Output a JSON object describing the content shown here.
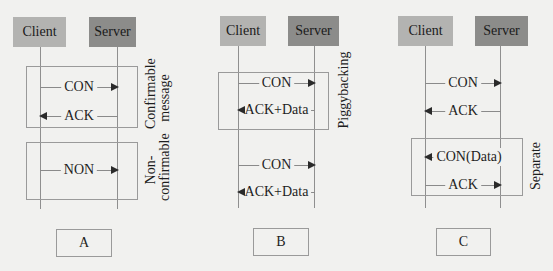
{
  "diagrams": [
    {
      "id": "A",
      "caption": "A",
      "client_label": "Client",
      "server_label": "Server",
      "groups": [
        {
          "label_line1": "Confirmable",
          "label_line2": "message"
        },
        {
          "label_line1": "Non-",
          "label_line2": "confirmable"
        }
      ],
      "messages": [
        {
          "label": "CON",
          "direction": "client-to-server"
        },
        {
          "label": "ACK",
          "direction": "server-to-client"
        },
        {
          "label": "NON",
          "direction": "client-to-server"
        }
      ]
    },
    {
      "id": "B",
      "caption": "B",
      "client_label": "Client",
      "server_label": "Server",
      "groups": [
        {
          "label_line1": "Piggybacking"
        }
      ],
      "messages": [
        {
          "label": "CON",
          "direction": "client-to-server"
        },
        {
          "label": "ACK+Data",
          "direction": "server-to-client"
        },
        {
          "label": "CON",
          "direction": "client-to-server"
        },
        {
          "label": "ACK+Data",
          "direction": "server-to-client"
        }
      ]
    },
    {
      "id": "C",
      "caption": "C",
      "client_label": "Client",
      "server_label": "Server",
      "groups": [
        {
          "label_line1": "Separate"
        }
      ],
      "messages": [
        {
          "label": "CON",
          "direction": "client-to-server"
        },
        {
          "label": "ACK",
          "direction": "server-to-client"
        },
        {
          "label": "CON(Data)",
          "direction": "server-to-client"
        },
        {
          "label": "ACK",
          "direction": "client-to-server"
        }
      ]
    }
  ],
  "colors": {
    "background": "#f1f1ef",
    "client_box": "#b3b3b1",
    "server_box": "#8c8c8a",
    "lines": "#8f8f8f",
    "arrowhead": "#2a2a2a"
  }
}
